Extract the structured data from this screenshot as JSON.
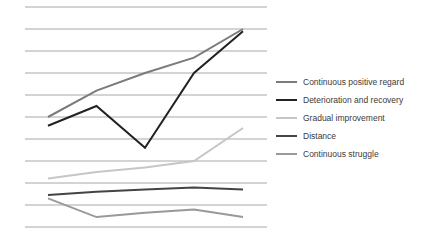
{
  "chart_data": {
    "type": "line",
    "title": "",
    "xlabel": "",
    "ylabel": "",
    "x": [
      1,
      2,
      3,
      4,
      5
    ],
    "ylim": [
      0,
      10
    ],
    "grid": true,
    "gridlines": 11,
    "legend_position": "right",
    "series": [
      {
        "name": "Continuous positive regard",
        "color": "#7b7b7b",
        "width": 2,
        "values": [
          5.0,
          6.2,
          7.0,
          7.7,
          9.0
        ]
      },
      {
        "name": "Deterioration and recovery",
        "color": "#222222",
        "width": 2,
        "values": [
          4.6,
          5.5,
          3.6,
          7.0,
          8.9
        ]
      },
      {
        "name": "Gradual improvement",
        "color": "#c6c6c6",
        "width": 2,
        "values": [
          2.2,
          2.5,
          2.7,
          3.0,
          4.5
        ]
      },
      {
        "name": "Distance",
        "color": "#444444",
        "width": 2,
        "values": [
          1.45,
          1.6,
          1.7,
          1.8,
          1.7
        ]
      },
      {
        "name": "Continuous struggle",
        "color": "#999999",
        "width": 2,
        "values": [
          1.3,
          0.45,
          0.65,
          0.8,
          0.45
        ]
      }
    ]
  },
  "legend": {
    "items": [
      {
        "label": "Continuous positive regard"
      },
      {
        "label": "Deterioration and recovery"
      },
      {
        "label": "Gradual improvement"
      },
      {
        "label": "Distance"
      },
      {
        "label": "Continuous struggle"
      }
    ]
  }
}
